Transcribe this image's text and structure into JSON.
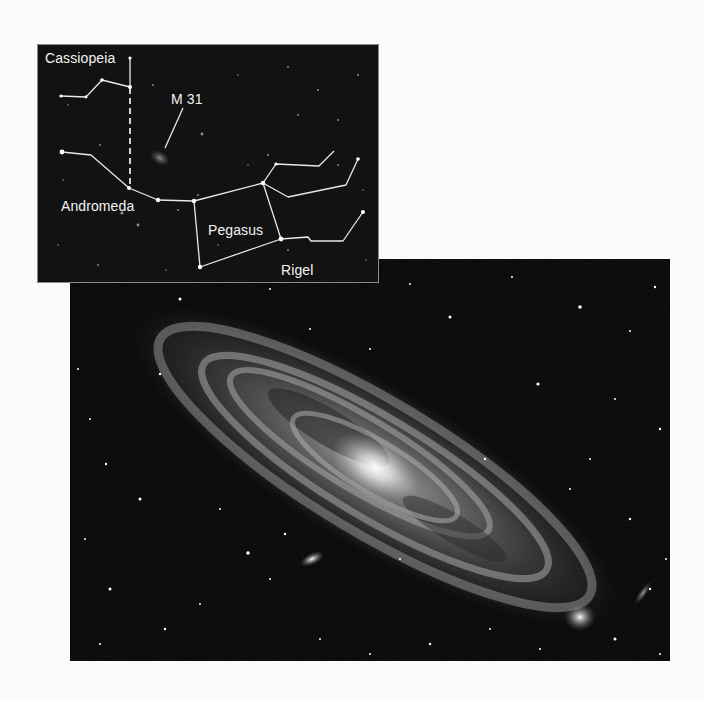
{
  "figure": {
    "colors": {
      "page_background": "#fbfbfb",
      "sky": "#050505",
      "inset_sky": "#121212",
      "lines": "#e8e8e8",
      "labels": "#f2f2f2"
    }
  },
  "inset_chart": {
    "labels": {
      "cassiopeia": "Cassiopeia",
      "m31": "M 31",
      "andromeda": "Andromeda",
      "pegasus": "Pegasus",
      "rigel": "Rigel"
    }
  },
  "galaxy_photo": {
    "subject": "M 31 Andromeda Galaxy",
    "companions": [
      "M 32",
      "NGC 205"
    ]
  }
}
